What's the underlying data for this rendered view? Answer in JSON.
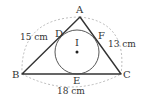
{
  "diagram": {
    "colors": {
      "stroke": "#333333",
      "dashed": "#aaaaaa",
      "background": "#ffffff"
    },
    "points": {
      "A": {
        "label": "A",
        "x": 80,
        "y": 17
      },
      "B": {
        "label": "B",
        "x": 22,
        "y": 74
      },
      "C": {
        "label": "C",
        "x": 121,
        "y": 74
      },
      "D": {
        "label": "D",
        "x": 59,
        "y": 31
      },
      "E": {
        "label": "E",
        "x": 77,
        "y": 74
      },
      "F": {
        "label": "F",
        "x": 98,
        "y": 34
      },
      "I": {
        "label": "I",
        "x": 77,
        "y": 52
      }
    },
    "incircle": {
      "cx": 77,
      "cy": 52,
      "r": 22
    },
    "sides": {
      "AB": {
        "label": "15 cm"
      },
      "AC": {
        "label": "13 cm"
      },
      "BC": {
        "label": "18 cm"
      }
    }
  }
}
